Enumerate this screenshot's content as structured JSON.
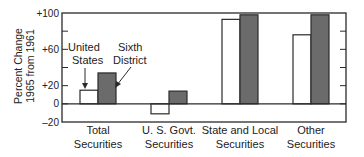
{
  "chart_data": {
    "type": "bar",
    "title": "",
    "xlabel": "",
    "ylabel": "Percent Change 1965 from 1961",
    "ylabel_lines": [
      "Percent Change",
      "1965 from 1961"
    ],
    "ylim": [
      -20,
      100
    ],
    "yticks": [
      -20,
      0,
      20,
      60,
      100
    ],
    "ytick_labels": [
      "‒20",
      "0",
      "+20",
      "+60",
      "+100"
    ],
    "minor_yticks": [
      40,
      80
    ],
    "grid": false,
    "categories": [
      "Total Securities",
      "U. S. Govt. Securities",
      "State and Local Securities",
      "Other Securities"
    ],
    "category_lines": [
      [
        "Total",
        "Securities"
      ],
      [
        "U. S. Govt.",
        "Securities"
      ],
      [
        "State and Local",
        "Securities"
      ],
      [
        "Other",
        "Securities"
      ]
    ],
    "series": [
      {
        "name": "United States",
        "name_lines": [
          "United",
          "States"
        ],
        "fill": "#ffffff",
        "values": [
          15,
          -11,
          93,
          76
        ]
      },
      {
        "name": "Sixth District",
        "name_lines": [
          "Sixth",
          "District"
        ],
        "fill": "#6b6b6b",
        "values": [
          34,
          14,
          98,
          98
        ]
      }
    ],
    "legend_position": "inline annotations with arrows over Total Securities bars"
  }
}
